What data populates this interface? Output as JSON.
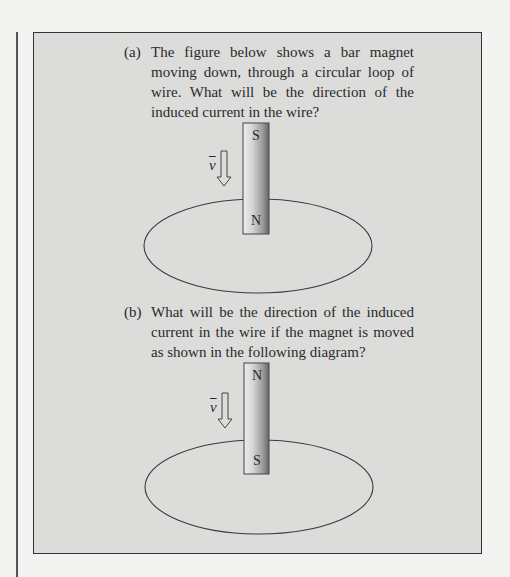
{
  "document": {
    "questions": [
      {
        "label": "(a)",
        "text": "The figure below shows a bar magnet moving down, through a circular loop of wire. What will be the direction of the induced current in the wire?",
        "figure": {
          "magnet_top_pole": "S",
          "magnet_bottom_pole": "N",
          "velocity_label": "v",
          "velocity_direction": "down"
        }
      },
      {
        "label": "(b)",
        "text": "What will be the direction of the induced current in the wire if the magnet is moved as shown in the following diagram?",
        "figure": {
          "magnet_top_pole": "N",
          "magnet_bottom_pole": "S",
          "velocity_label": "v",
          "velocity_direction": "down"
        }
      }
    ]
  },
  "colors": {
    "page_background": "#f3f3f1",
    "box_background": "#dcdcda",
    "border": "#333333",
    "text": "#2a2a2a"
  }
}
